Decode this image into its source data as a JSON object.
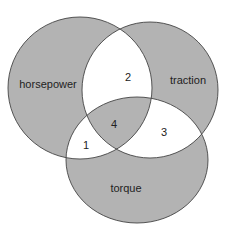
{
  "diagram": {
    "type": "venn",
    "sets": [
      {
        "label": "horsepower"
      },
      {
        "label": "traction"
      },
      {
        "label": "torque"
      }
    ],
    "regions": [
      {
        "label": "1",
        "sets": [
          "horsepower",
          "torque"
        ]
      },
      {
        "label": "2",
        "sets": [
          "horsepower",
          "traction"
        ]
      },
      {
        "label": "3",
        "sets": [
          "traction",
          "torque"
        ]
      },
      {
        "label": "4",
        "sets": [
          "horsepower",
          "traction",
          "torque"
        ]
      }
    ],
    "colors": {
      "fill_odd": "#b3b3b3",
      "fill_even": "#ffffff",
      "stroke": "#444444"
    }
  }
}
